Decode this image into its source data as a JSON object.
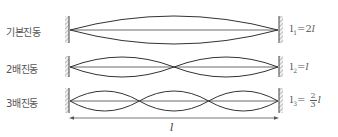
{
  "diagram": {
    "rows": [
      {
        "label": "기본진동",
        "equation": {
          "symbol": "l",
          "subscript": "1",
          "eq": "=",
          "coef": "2",
          "var": "l"
        },
        "loops": 1
      },
      {
        "label": "2배진동",
        "equation": {
          "symbol": "l",
          "subscript": "2",
          "eq": "=",
          "coef": "",
          "var": "l"
        },
        "loops": 2
      },
      {
        "label": "3배진동",
        "equation": {
          "symbol": "l",
          "subscript": "3",
          "eq": "=",
          "frac_num": "2",
          "frac_den": "3",
          "var": "l"
        },
        "loops": 3
      }
    ],
    "length_label": "l",
    "colors": {
      "string": "#333333",
      "wall_hatch": "#888888",
      "text": "#555555"
    }
  }
}
